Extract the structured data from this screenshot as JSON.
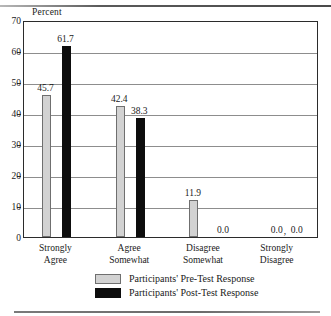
{
  "chart_data": {
    "type": "bar",
    "title": "",
    "xlabel": "",
    "ylabel": "Percent",
    "ylim": [
      0,
      70
    ],
    "yticks": [
      0,
      10,
      20,
      30,
      40,
      50,
      60,
      70
    ],
    "grid": true,
    "legend_position": "bottom",
    "categories": [
      "Strongly\nAgree",
      "Agree\nSomewhat",
      "Disagree\nSomewhat",
      "Strongly\nDisagree"
    ],
    "category_lines": [
      [
        "Strongly",
        "Agree"
      ],
      [
        "Agree",
        "Somewhat"
      ],
      [
        "Disagree",
        "Somewhat"
      ],
      [
        "Strongly",
        "Disagree"
      ]
    ],
    "series": [
      {
        "name": "Participants' Pre-Test Response",
        "color": "#d2d2d2",
        "values": [
          45.7,
          42.4,
          11.9,
          0.0
        ],
        "labels": [
          "45.7",
          "42.4",
          "11.9",
          "0.0"
        ]
      },
      {
        "name": "Participants' Post-Test Response",
        "color": "#0d0d0d",
        "values": [
          61.7,
          38.3,
          0.0,
          0.0
        ],
        "labels": [
          "61.7",
          "38.3",
          "0.0",
          "0.0"
        ]
      }
    ]
  },
  "axis": {
    "y_title": "Percent",
    "tick_labels": [
      "70",
      "60",
      "50",
      "40",
      "30",
      "20",
      "10",
      "0"
    ]
  },
  "legend": {
    "items": [
      {
        "label": "Participants' Pre-Test Response",
        "swatch": "pre"
      },
      {
        "label": "Participants' Post-Test Response",
        "swatch": "post"
      }
    ]
  },
  "marks": {
    "separator_comma": ","
  }
}
